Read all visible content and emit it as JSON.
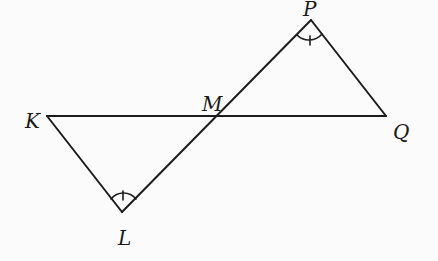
{
  "diagram": {
    "type": "geometry",
    "colors": {
      "stroke": "#1c1c1c",
      "background": "#fbfbfb"
    },
    "points": {
      "K": {
        "label": "K",
        "x": 47,
        "y": 116
      },
      "Q": {
        "label": "Q",
        "x": 386,
        "y": 116
      },
      "M": {
        "label": "M",
        "x": 218,
        "y": 116
      },
      "P": {
        "label": "P",
        "x": 311,
        "y": 20
      },
      "L": {
        "label": "L",
        "x": 122,
        "y": 212
      }
    },
    "segments": [
      [
        "K",
        "Q"
      ],
      [
        "K",
        "L"
      ],
      [
        "L",
        "P"
      ],
      [
        "P",
        "Q"
      ]
    ],
    "angle_marks": [
      {
        "vertex": "L",
        "mark": "single tick arc"
      },
      {
        "vertex": "P",
        "mark": "single tick arc"
      }
    ]
  }
}
